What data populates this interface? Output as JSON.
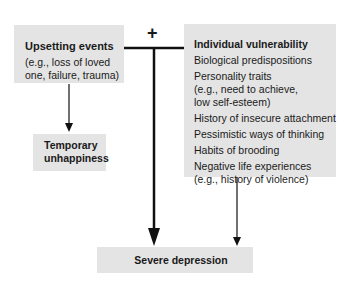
{
  "diagram": {
    "operator": "+",
    "upsetting_events": {
      "title": "Upsetting events",
      "description_line1": "(e.g., loss of loved",
      "description_line2": "one, failure, trauma)"
    },
    "individual_vulnerability": {
      "title": "Individual vulnerability",
      "items": [
        "Biological predispositions",
        "Personality traits",
        "History of insecure attachment",
        "Pessimistic ways of thinking",
        "Habits of brooding",
        "Negative life experiences"
      ],
      "personality_detail_line1": "(e.g., need to achieve,",
      "personality_detail_line2": "low self-esteem)",
      "negative_detail": "(e.g., history of violence)"
    },
    "temporary_unhappiness": {
      "line1": "Temporary",
      "line2": "unhappiness"
    },
    "severe_depression": {
      "label": "Severe depression"
    },
    "colors": {
      "box_fill": "#e4e4e4",
      "line": "#111111",
      "text": "#1a1a1a"
    }
  }
}
